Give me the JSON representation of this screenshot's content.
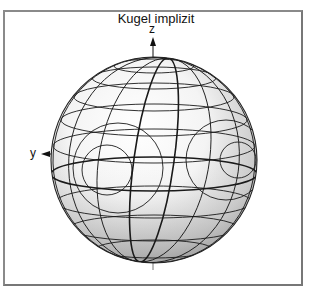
{
  "figure": {
    "title": "Kugel implizit",
    "axes": {
      "z_label": "z",
      "y_label": "y"
    },
    "object": "sphere",
    "rendering": "shaded sphere with latitude/longitude grid",
    "colors": {
      "frame": "#8a8a8a",
      "grid": "#1a1a1a",
      "shade_light": "#ffffff",
      "shade_dark": "#9a9a9a"
    }
  }
}
